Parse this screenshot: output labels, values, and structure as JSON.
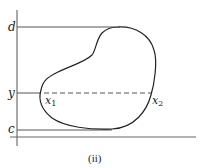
{
  "figure": {
    "caption": "(ii)",
    "labels": {
      "d": "d",
      "y": "y",
      "c": "c",
      "x1": "x",
      "x1_sub": "1",
      "x2": "x",
      "x2_sub": "2"
    },
    "colors": {
      "stroke": "#222222",
      "axis": "#555555",
      "background": "#ffffff"
    }
  }
}
